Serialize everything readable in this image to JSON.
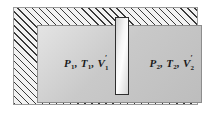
{
  "figure": {
    "outer_wall": {
      "name": "insulated-hatched-wall",
      "hatch_pattern": "diagonal-45",
      "hatch_color": "#3a3a3a",
      "fill_color": "#f2f2f2"
    },
    "cavity": {
      "name": "gas-cavity",
      "fill_gradient_from": "#e4e4e4",
      "fill_gradient_to": "#bdbdbd",
      "border_color": "#8d8d8d"
    },
    "partition": {
      "name": "partition-plate",
      "border_color": "#2e2e2e",
      "fill_gradient_from": "#cfcfcf",
      "fill_gradient_to": "#fdfdfd"
    },
    "chambers": [
      {
        "id": "chamber-1",
        "pressure": "P",
        "pressure_sub": "1",
        "temperature": "T",
        "temperature_sub": "1",
        "volume": "V",
        "volume_sub": "1",
        "volume_prime": "′",
        "separator": ", "
      },
      {
        "id": "chamber-2",
        "pressure": "P",
        "pressure_sub": "2",
        "temperature": "T",
        "temperature_sub": "2",
        "volume": "V",
        "volume_sub": "2",
        "volume_prime": "′",
        "separator": ", "
      }
    ]
  }
}
